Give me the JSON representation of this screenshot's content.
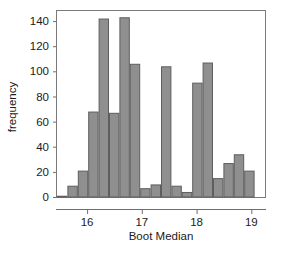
{
  "chart_data": {
    "type": "bar",
    "title": "",
    "subtitle": "",
    "xlabel": "Boot Median",
    "ylabel": "frequency",
    "grid": false,
    "legend": null,
    "xlim": [
      15.45,
      19.25
    ],
    "ylim": [
      0,
      148
    ],
    "xticks": [
      16,
      17,
      18,
      19
    ],
    "xtick_labels": [
      "16",
      "17",
      "18",
      "19"
    ],
    "yticks": [
      0,
      20,
      40,
      60,
      80,
      100,
      120,
      140
    ],
    "ytick_labels": [
      "0",
      "20",
      "40",
      "60",
      "80",
      "100",
      "120",
      "140"
    ],
    "bin_width": 0.19,
    "bin_starts": [
      15.45,
      15.64,
      15.83,
      16.02,
      16.21,
      16.4,
      16.59,
      16.78,
      16.97,
      17.16,
      17.35,
      17.54,
      17.73,
      17.92,
      18.11,
      18.3,
      18.49,
      18.68,
      18.87,
      19.06
    ],
    "categories": [
      "15.45",
      "15.64",
      "15.83",
      "16.02",
      "16.21",
      "16.40",
      "16.59",
      "16.78",
      "16.97",
      "17.16",
      "17.35",
      "17.54",
      "17.73",
      "17.92",
      "18.11",
      "18.30",
      "18.49",
      "18.68",
      "18.87",
      "19.06"
    ],
    "values": [
      1,
      9,
      21,
      68,
      142,
      67,
      143,
      106,
      7,
      10,
      104,
      9,
      4,
      91,
      107,
      15,
      27,
      34,
      21,
      0
    ],
    "bar_color": "#8f8f8f",
    "bar_edge_color": "#5e5e5e",
    "frame_color": "#7a7a7a"
  },
  "axes": {
    "x_axis_title": "Boot Median",
    "y_axis_title": "frequency"
  }
}
